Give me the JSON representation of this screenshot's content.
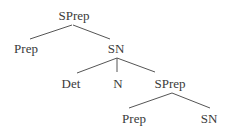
{
  "diagram": {
    "type": "syntax-tree",
    "nodes": {
      "root": "SPrep",
      "prep1": "Prep",
      "sn1": "SN",
      "det": "Det",
      "n": "N",
      "sprep2": "SPrep",
      "prep2": "Prep",
      "sn2": "SN"
    },
    "edges": [
      [
        "SPrep",
        "Prep"
      ],
      [
        "SPrep",
        "SN"
      ],
      [
        "SN",
        "Det"
      ],
      [
        "SN",
        "N"
      ],
      [
        "SN",
        "SPrep"
      ],
      [
        "SPrep",
        "Prep"
      ],
      [
        "SPrep",
        "SN"
      ]
    ],
    "colors": {
      "text": "#3a3a3a",
      "line": "#555555",
      "background": "#ffffff"
    }
  }
}
